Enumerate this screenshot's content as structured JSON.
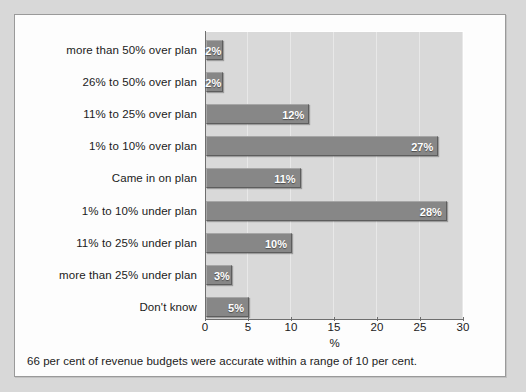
{
  "chart_data": {
    "type": "bar",
    "orientation": "horizontal",
    "title": "",
    "subtitle": "",
    "xlabel": "%",
    "ylabel": "",
    "xlim": [
      0,
      30
    ],
    "xticks": [
      0,
      5,
      10,
      15,
      20,
      25,
      30
    ],
    "grid": true,
    "legend": "none",
    "categories": [
      "more than 50% over plan",
      "26% to 50% over plan",
      "11% to 25% over plan",
      "1% to 10% over plan",
      "Came in on plan",
      "1% to 10% under plan",
      "11% to 25% under plan",
      "more than 25% under plan",
      "Don't know"
    ],
    "values": [
      2,
      2,
      12,
      27,
      11,
      28,
      10,
      3,
      5
    ],
    "data_labels": [
      "2%",
      "2%",
      "12%",
      "27%",
      "11%",
      "28%",
      "10%",
      "3%",
      "5%"
    ],
    "annotations": [
      "66 per cent of revenue budgets were accurate within a range of 10 per cent."
    ]
  },
  "caption": "66 per cent of revenue budgets were accurate within a range of 10 per cent.",
  "colors": {
    "bar_fill": "#878787",
    "bar_label": "#ffffff",
    "plot_background": "#d9d9d9",
    "gridline": "#e8e8e8",
    "axis": "#6e6e6e",
    "card_background": "#fdfdfd",
    "page_background": "#d8d8d8",
    "text": "#1b1b1b"
  }
}
